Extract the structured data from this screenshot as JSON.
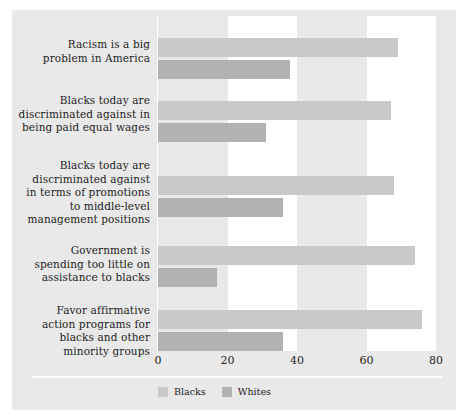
{
  "chart_data": {
    "type": "bar",
    "orientation": "horizontal",
    "title": "",
    "subtitle": "",
    "xlabel": "",
    "ylabel": "",
    "xlim": [
      0,
      80
    ],
    "xticks": [
      "0",
      "20",
      "40",
      "60",
      "80"
    ],
    "xtick_values": [
      0,
      20,
      40,
      60,
      80
    ],
    "grid": "alternating vertical bands",
    "legend_position": "bottom-left",
    "categories": [
      "Racism is a big problem in America",
      "Blacks today are discriminated against in being paid equal wages",
      "Blacks today are discriminated against in terms of promotions to middle-level management positions",
      "Government is spending too little on assistance to blacks",
      "Favor affirmative action programs for blacks and other minority groups"
    ],
    "category_lines": [
      [
        "Racism is a big",
        "problem in America"
      ],
      [
        "Blacks today are",
        "discriminated against in",
        "being paid equal wages"
      ],
      [
        "Blacks today are",
        "discriminated against",
        "in terms of promotions",
        "to middle-level",
        "management positions"
      ],
      [
        "Government is",
        "spending too little on",
        "assistance to blacks"
      ],
      [
        "Favor affirmative",
        "action programs for",
        "blacks and other",
        "minority groups"
      ]
    ],
    "series": [
      {
        "name": "Blacks",
        "color": "#c9c9c9",
        "values": [
          69,
          67,
          68,
          74,
          76
        ]
      },
      {
        "name": "Whites",
        "color": "#b2b2b2",
        "values": [
          38,
          31,
          36,
          17,
          36
        ]
      }
    ]
  },
  "legend": {
    "items": [
      {
        "label": "Blacks"
      },
      {
        "label": "Whites"
      }
    ]
  },
  "colors": {
    "background": "#e9e9e9",
    "band": "#ffffff",
    "blacks_bar": "#c9c9c9",
    "whites_bar": "#b2b2b2",
    "text": "#1d1d1d"
  }
}
